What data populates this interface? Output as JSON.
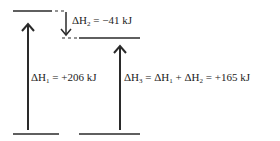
{
  "diagram": {
    "type": "enthalpy-level-diagram",
    "labels": {
      "dh1": {
        "symbol": "ΔH",
        "sub": "1",
        "sup": "°",
        "value": "= +206 kJ"
      },
      "dh2": {
        "symbol": "ΔH",
        "sub": "2",
        "sup": "°",
        "value": "= −41 kJ"
      },
      "dh3": {
        "prefix_symbol": "ΔH",
        "prefix_sub": "3",
        "sup": "°",
        "eq1": "= ΔH",
        "eq1_sub": "1",
        "plus": "+ ΔH",
        "eq2_sub": "2",
        "value": "= +165 kJ"
      }
    },
    "colors": {
      "line": "#2a2a2a",
      "dash": "#2a2a2a",
      "text": "#222222"
    }
  }
}
